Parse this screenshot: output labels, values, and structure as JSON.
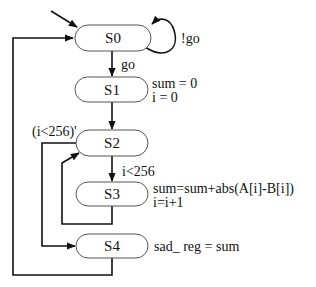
{
  "diagram": {
    "type": "state-machine",
    "states": [
      {
        "id": "S0",
        "label": "S0"
      },
      {
        "id": "S1",
        "label": "S1",
        "actions": [
          "sum = 0",
          "i = 0"
        ]
      },
      {
        "id": "S2",
        "label": "S2"
      },
      {
        "id": "S3",
        "label": "S3",
        "actions": [
          "sum=sum+abs(A[i]-B[i])",
          "i=i+1"
        ]
      },
      {
        "id": "S4",
        "label": "S4",
        "actions": [
          "sad_ reg = sum"
        ]
      }
    ],
    "transitions": [
      {
        "from": "reset",
        "to": "S0",
        "label": ""
      },
      {
        "from": "S0",
        "to": "S0",
        "label": "!go"
      },
      {
        "from": "S0",
        "to": "S1",
        "label": "go"
      },
      {
        "from": "S1",
        "to": "S2",
        "label": ""
      },
      {
        "from": "S2",
        "to": "S3",
        "label": "i<256"
      },
      {
        "from": "S3",
        "to": "S2",
        "label": ""
      },
      {
        "from": "S2",
        "to": "S4",
        "label": "(i<256)'"
      },
      {
        "from": "S4",
        "to": "S0",
        "label": ""
      }
    ]
  }
}
